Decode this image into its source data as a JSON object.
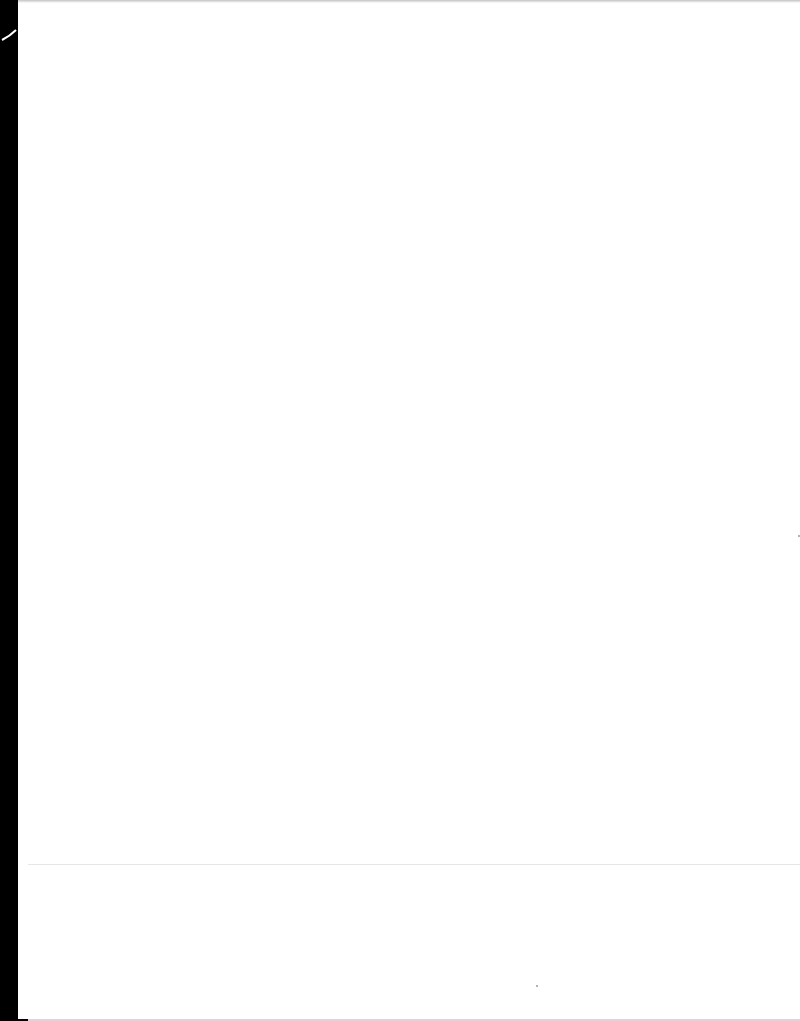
{
  "document": {
    "type": "blank scanned page",
    "text": ""
  }
}
